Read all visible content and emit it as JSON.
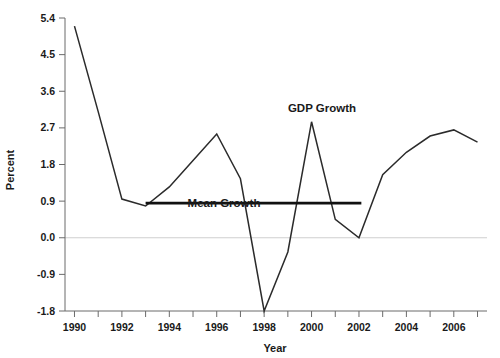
{
  "chart_data": {
    "type": "line",
    "title": "",
    "xlabel": "Year",
    "ylabel": "Percent",
    "xlim": [
      1989.6,
      2007.4
    ],
    "ylim": [
      -1.8,
      5.4
    ],
    "yticks": [
      "5.4",
      "4.5",
      "3.6",
      "2.7",
      "1.8",
      "0.9",
      "0.0",
      "-0.9",
      "-1.8"
    ],
    "ytick_values": [
      5.4,
      4.5,
      3.6,
      2.7,
      1.8,
      0.9,
      0.0,
      -0.9,
      -1.8
    ],
    "xticks": [
      "1990",
      "1992",
      "1994",
      "1996",
      "1998",
      "2000",
      "2002",
      "2004",
      "2006"
    ],
    "xtick_values": [
      1990,
      1992,
      1994,
      1996,
      1998,
      2000,
      2002,
      2004,
      2006
    ],
    "xtick_minor_values": [
      1991,
      1993,
      1995,
      1997,
      1999,
      2001,
      2003,
      2005,
      2007
    ],
    "grid": false,
    "zero_line": true,
    "legend_position": "inline-annotation",
    "x": [
      1990,
      1991,
      1992,
      1993,
      1994,
      1995,
      1996,
      1997,
      1998,
      1999,
      2000,
      2001,
      2002,
      2003,
      2004,
      2005,
      2006,
      2007
    ],
    "series": [
      {
        "name": "GDP Growth",
        "color": "#2b2b2b",
        "annotation": "GDP Growth",
        "values": [
          5.2,
          3.1,
          0.95,
          0.78,
          1.25,
          1.9,
          2.55,
          1.45,
          -1.8,
          -0.35,
          2.85,
          0.45,
          0.0,
          1.55,
          2.1,
          2.5,
          2.65,
          2.35
        ]
      },
      {
        "name": "Mean Growth",
        "color": "#111111",
        "annotation": "Mean Growth",
        "type": "horizontal-reference",
        "value": 0.85,
        "x_start": 1993.0,
        "x_end": 2002.1
      }
    ]
  },
  "annotations": {
    "gdp_growth_label": "GDP Growth",
    "mean_growth_label": "Mean Growth"
  },
  "axes": {
    "x_title": "Year",
    "y_title": "Percent"
  },
  "colors": {
    "series_line": "#2b2b2b",
    "mean_line": "#111111",
    "axis": "#6b6b6b",
    "zero_line": "#cfcfcf",
    "text": "#1a1a1a",
    "background": "#ffffff"
  }
}
